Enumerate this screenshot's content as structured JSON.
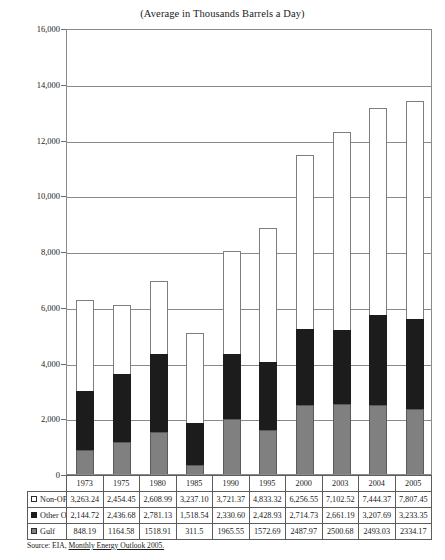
{
  "chart_data": {
    "type": "bar",
    "subtype": "stacked-column",
    "title": "(Average in Thousands Barrels a Day)",
    "xlabel": "",
    "ylabel": "",
    "ylim": [
      0,
      16000
    ],
    "ytick_values": [
      0,
      2000,
      4000,
      6000,
      8000,
      10000,
      12000,
      14000,
      16000
    ],
    "ytick_labels": [
      "0",
      "2,000",
      "4,000",
      "6,000",
      "8,000",
      "10,000",
      "12,000",
      "14,000",
      "16,000"
    ],
    "grid": true,
    "legend_position": "table-row-labels",
    "categories": [
      "1973",
      "1975",
      "1980",
      "1985",
      "1990",
      "1995",
      "2000",
      "2003",
      "2004",
      "2005"
    ],
    "series": [
      {
        "name": "Gulf",
        "color": "#808080",
        "stack_order": 0,
        "values": [
          848.19,
          1164.58,
          1518.91,
          311.5,
          1965.55,
          1572.69,
          2487.97,
          2500.68,
          2493.03,
          2334.17
        ],
        "labels": [
          "848.19",
          "1164.58",
          "1518.91",
          "311.5",
          "1965.55",
          "1572.69",
          "2487.97",
          "2500.68",
          "2493.03",
          "2334.17"
        ]
      },
      {
        "name": "Other OPEC",
        "color": "#1c1c1c",
        "stack_order": 1,
        "values": [
          2144.72,
          2436.68,
          2781.13,
          1518.54,
          2330.6,
          2428.93,
          2714.73,
          2661.19,
          3207.69,
          3233.35
        ],
        "labels": [
          "2,144.72",
          "2,436.68",
          "2,781.13",
          "1,518.54",
          "2,330.60",
          "2,428.93",
          "2,714.73",
          "2,661.19",
          "3,207.69",
          "3,233.35"
        ]
      },
      {
        "name": "Non-OPEC",
        "color": "#ffffff",
        "stack_order": 2,
        "values": [
          3263.24,
          2454.45,
          2608.99,
          3237.1,
          3721.37,
          4833.32,
          6256.55,
          7102.52,
          7444.37,
          7807.45
        ],
        "labels": [
          "3,263.24",
          "2,454.45",
          "2,608.99",
          "3,237.10",
          "3,721.37",
          "4,833.32",
          "6,256.55",
          "7,102.52",
          "7,444.37",
          "7,807.45"
        ]
      }
    ],
    "totals": [
      6256.15,
      6055.71,
      6909.03,
      5067.14,
      8017.52,
      8834.94,
      11459.25,
      12264.39,
      13145.09,
      13374.97
    ]
  },
  "table": {
    "corner_label": "",
    "year_headers": [
      "1973",
      "1975",
      "1980",
      "1985",
      "1990",
      "1995",
      "2000",
      "2003",
      "2004",
      "2005"
    ],
    "rows": [
      {
        "label": "Non-OPEC",
        "swatch": "white-square-icon",
        "values": [
          "3,263.24",
          "2,454.45",
          "2,608.99",
          "3,237.10",
          "3,721.37",
          "4,833.32",
          "6,256.55",
          "7,102.52",
          "7,444.37",
          "7,807.45"
        ]
      },
      {
        "label": "Other OPEC",
        "swatch": "black-square-icon",
        "values": [
          "2,144.72",
          "2,436.68",
          "2,781.13",
          "1,518.54",
          "2,330.60",
          "2,428.93",
          "2,714.73",
          "2,661.19",
          "3,207.69",
          "3,233.35"
        ]
      },
      {
        "label": "Gulf",
        "swatch": "gray-square-icon",
        "values": [
          "848.19",
          "1164.58",
          "1518.91",
          "311.5",
          "1965.55",
          "1572.69",
          "2487.97",
          "2500.68",
          "2493.03",
          "2334.17"
        ]
      }
    ]
  },
  "source": {
    "prefix": "Source:  EIA, ",
    "publication": "Monthly Energy Outlook 2005."
  }
}
